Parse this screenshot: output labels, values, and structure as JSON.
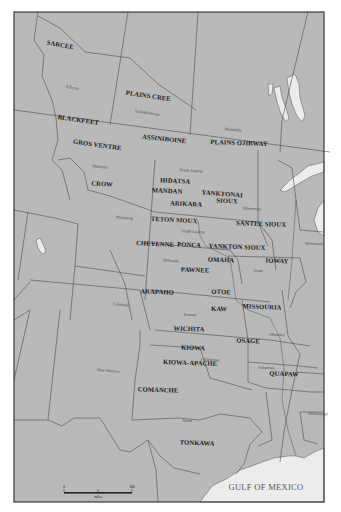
{
  "map": {
    "title": "Plains Indian tribal territories",
    "colors": {
      "land": "#b9b9b9",
      "water": "#ececec",
      "border": "#4d4d4d",
      "frame": "#2b2b2b",
      "background": "#ffffff"
    },
    "water_label": "GULF OF MEXICO",
    "scale_bar": {
      "ticks": [
        "0",
        "",
        "300"
      ],
      "unit": "miles"
    },
    "tribes": [
      {
        "name": "SARCEE",
        "x": 60,
        "y": 47,
        "rot": 10
      },
      {
        "name": "PLAINS CREE",
        "x": 148,
        "y": 98,
        "rot": 8
      },
      {
        "name": "BLACKFEET",
        "x": 78,
        "y": 122,
        "rot": 8
      },
      {
        "name": "ASSINIBOINE",
        "x": 164,
        "y": 141,
        "rot": 6
      },
      {
        "name": "PLAINS OJIBWAY",
        "x": 239,
        "y": 145,
        "rot": 2
      },
      {
        "name": "GROS VENTRE",
        "x": 97,
        "y": 147,
        "rot": 8
      },
      {
        "name": "CROW",
        "x": 102,
        "y": 186,
        "rot": 3
      },
      {
        "name": "HIDATSA",
        "x": 175,
        "y": 183,
        "rot": 3
      },
      {
        "name": "MANDAN",
        "x": 167,
        "y": 193,
        "rot": 3
      },
      {
        "name": "YANKTONAI",
        "x": 222,
        "y": 196,
        "rot": 4
      },
      {
        "name": "SIOUX",
        "x": 227,
        "y": 203,
        "rot": 3
      },
      {
        "name": "ARIKARA",
        "x": 186,
        "y": 206,
        "rot": 3
      },
      {
        "name": "SANTEE SIOUX",
        "x": 261,
        "y": 226,
        "rot": 2
      },
      {
        "name": "TETON SIOUX",
        "x": 174,
        "y": 222,
        "rot": 3
      },
      {
        "name": "CHEYENNE",
        "x": 155,
        "y": 246,
        "rot": 3
      },
      {
        "name": "PONCA",
        "x": 189,
        "y": 247,
        "rot": 3
      },
      {
        "name": "YANKTON SIOUX",
        "x": 237,
        "y": 249,
        "rot": 2
      },
      {
        "name": "OMAHA",
        "x": 221,
        "y": 262,
        "rot": 2
      },
      {
        "name": "IOWAY",
        "x": 277,
        "y": 263,
        "rot": 2
      },
      {
        "name": "PAWNEE",
        "x": 195,
        "y": 272,
        "rot": 2
      },
      {
        "name": "ARAPAHO",
        "x": 157,
        "y": 294,
        "rot": 2
      },
      {
        "name": "OTOE",
        "x": 221,
        "y": 294,
        "rot": 2
      },
      {
        "name": "MISSOURIA",
        "x": 262,
        "y": 309,
        "rot": 2
      },
      {
        "name": "KAW",
        "x": 219,
        "y": 311,
        "rot": 2
      },
      {
        "name": "WICHITA",
        "x": 189,
        "y": 331,
        "rot": 2
      },
      {
        "name": "OSAGE",
        "x": 248,
        "y": 343,
        "rot": 2
      },
      {
        "name": "KIOWA",
        "x": 193,
        "y": 350,
        "rot": 2
      },
      {
        "name": "KIOWA-APACHE",
        "x": 190,
        "y": 365,
        "rot": 2
      },
      {
        "name": "QUAPAW",
        "x": 284,
        "y": 376,
        "rot": 2
      },
      {
        "name": "COMANCHE",
        "x": 158,
        "y": 392,
        "rot": 2
      },
      {
        "name": "TONKAWA",
        "x": 197,
        "y": 445,
        "rot": 2
      }
    ],
    "regions": [
      {
        "name": "Alberta",
        "x": 72,
        "y": 89,
        "rot": 10
      },
      {
        "name": "Saskatchewan",
        "x": 147,
        "y": 114,
        "rot": 8
      },
      {
        "name": "Manitoba",
        "x": 233,
        "y": 131,
        "rot": 5
      },
      {
        "name": "Montana",
        "x": 100,
        "y": 168,
        "rot": 5
      },
      {
        "name": "North Dakota",
        "x": 191,
        "y": 172,
        "rot": 3
      },
      {
        "name": "Minnesota",
        "x": 252,
        "y": 210,
        "rot": 3
      },
      {
        "name": "Wyoming",
        "x": 124,
        "y": 219,
        "rot": 5
      },
      {
        "name": "South Dakota",
        "x": 193,
        "y": 233,
        "rot": 3
      },
      {
        "name": "Wisconsin",
        "x": 314,
        "y": 245,
        "rot": 2
      },
      {
        "name": "Nebraska",
        "x": 171,
        "y": 262,
        "rot": 3
      },
      {
        "name": "Iowa",
        "x": 258,
        "y": 272,
        "rot": 2
      },
      {
        "name": "Colorado",
        "x": 121,
        "y": 306,
        "rot": 5
      },
      {
        "name": "Kansas",
        "x": 190,
        "y": 316,
        "rot": 2
      },
      {
        "name": "Missouri",
        "x": 277,
        "y": 336,
        "rot": 2
      },
      {
        "name": "Oklahoma",
        "x": 210,
        "y": 361,
        "rot": 2
      },
      {
        "name": "Arkansas",
        "x": 266,
        "y": 369,
        "rot": 2
      },
      {
        "name": "New Mexico",
        "x": 108,
        "y": 372,
        "rot": 5
      },
      {
        "name": "Texas",
        "x": 187,
        "y": 422,
        "rot": 2
      },
      {
        "name": "Mississippi",
        "x": 318,
        "y": 415,
        "rot": 2
      }
    ]
  }
}
